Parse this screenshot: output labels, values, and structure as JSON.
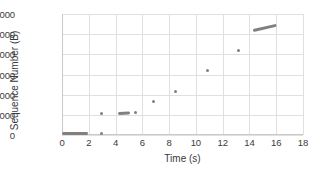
{
  "chart_data": {
    "type": "scatter",
    "title": "",
    "xlabel": "Time (s)",
    "ylabel": "Sequence Number (B)",
    "xlim": [
      0,
      18
    ],
    "ylim": [
      0,
      6000
    ],
    "xticks": [
      0,
      2,
      4,
      6,
      8,
      10,
      12,
      14,
      16,
      18
    ],
    "yticks": [
      0,
      1000,
      2000,
      3000,
      4000,
      5000,
      6000
    ],
    "grid": true,
    "legend": null,
    "marker_color": "#808080",
    "gridline_color": "#e0e0e0",
    "background": "#ffffff",
    "series": [
      {
        "name": "Sequence Number",
        "points": [
          {
            "x": 0.05,
            "y": 50
          },
          {
            "x": 0.2,
            "y": 50
          },
          {
            "x": 0.4,
            "y": 50
          },
          {
            "x": 0.6,
            "y": 50
          },
          {
            "x": 0.8,
            "y": 50
          },
          {
            "x": 1.0,
            "y": 50
          },
          {
            "x": 1.2,
            "y": 50
          },
          {
            "x": 1.4,
            "y": 50
          },
          {
            "x": 1.6,
            "y": 50
          },
          {
            "x": 1.7,
            "y": 55
          },
          {
            "x": 2.95,
            "y": 60
          },
          {
            "x": 2.95,
            "y": 1060
          },
          {
            "x": 4.15,
            "y": 1090
          },
          {
            "x": 4.35,
            "y": 1100
          },
          {
            "x": 4.55,
            "y": 1105
          },
          {
            "x": 4.75,
            "y": 1110
          },
          {
            "x": 4.85,
            "y": 1115
          },
          {
            "x": 5.5,
            "y": 1130
          },
          {
            "x": 6.8,
            "y": 1650
          },
          {
            "x": 8.5,
            "y": 2150
          },
          {
            "x": 10.85,
            "y": 3180
          },
          {
            "x": 13.2,
            "y": 4200
          },
          {
            "x": 14.3,
            "y": 5180
          },
          {
            "x": 14.7,
            "y": 5240
          },
          {
            "x": 15.1,
            "y": 5300
          },
          {
            "x": 15.45,
            "y": 5350
          },
          {
            "x": 15.8,
            "y": 5400
          }
        ]
      }
    ],
    "clusters": [
      {
        "name": "baseline-burst",
        "x_start": 0.0,
        "x_end": 1.7,
        "y_start": 50,
        "y_end": 55
      },
      {
        "name": "single-low",
        "x_start": 2.95,
        "x_end": 2.95,
        "y_start": 60,
        "y_end": 60
      },
      {
        "name": "single-1060",
        "x_start": 2.95,
        "x_end": 2.95,
        "y_start": 1060,
        "y_end": 1060
      },
      {
        "name": "mid-burst",
        "x_start": 4.15,
        "x_end": 4.85,
        "y_start": 1090,
        "y_end": 1115
      },
      {
        "name": "single-1130",
        "x_start": 5.5,
        "x_end": 5.5,
        "y_start": 1130,
        "y_end": 1130
      },
      {
        "name": "single-1650",
        "x_start": 6.8,
        "x_end": 6.8,
        "y_start": 1650,
        "y_end": 1650
      },
      {
        "name": "single-2150",
        "x_start": 8.5,
        "x_end": 8.5,
        "y_start": 2150,
        "y_end": 2150
      },
      {
        "name": "single-3180",
        "x_start": 10.85,
        "x_end": 10.85,
        "y_start": 3180,
        "y_end": 3180
      },
      {
        "name": "single-4200",
        "x_start": 13.2,
        "x_end": 13.2,
        "y_start": 4200,
        "y_end": 4200
      },
      {
        "name": "final-burst",
        "x_start": 14.3,
        "x_end": 15.8,
        "y_start": 5180,
        "y_end": 5400
      }
    ]
  }
}
